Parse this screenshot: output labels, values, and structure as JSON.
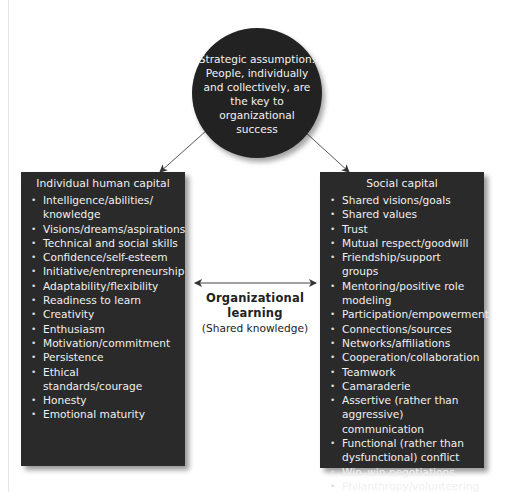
{
  "diagram": {
    "strategic_assumption": {
      "text": "Strategic assumption: People, individually and collectively, are the key to organizational success"
    },
    "individual_human_capital": {
      "title": "Individual human capital",
      "items": [
        "Intelligence/abilities/ knowledge",
        "Visions/dreams/aspirations",
        "Technical and social skills",
        "Confidence/self-esteem",
        "Initiative/entrepreneurship",
        "Adaptability/flexibility",
        "Readiness to learn",
        "Creativity",
        "Enthusiasm",
        "Motivation/commitment",
        "Persistence",
        "Ethical standards/courage",
        "Honesty",
        "Emotional maturity"
      ]
    },
    "social_capital": {
      "title": "Social capital",
      "items": [
        "Shared visions/goals",
        "Shared values",
        "Trust",
        "Mutual respect/goodwill",
        "Friendship/support groups",
        "Mentoring/positive role modeling",
        "Participation/empowerment",
        "Connections/sources",
        "Networks/affiliations",
        "Cooperation/collaboration",
        "Teamwork",
        "Camaraderie",
        "Assertive (rather than aggressive) communication",
        "Functional (rather than dysfunctional) conflict",
        "Win–win negotiations",
        "Philanthropy/volunteering"
      ]
    },
    "organizational_learning": {
      "title": "Organizational learning",
      "subtitle": "(Shared knowledge)"
    },
    "icons": {
      "arrow_left": "arrow-down-left-icon",
      "arrow_right": "arrow-down-right-icon",
      "double_arrow": "double-headed-arrow-icon"
    },
    "colors": {
      "box_fill": "#2a2a2a",
      "circle_fill": "#222222",
      "text_light": "#f0f0f0",
      "arrow": "#444444"
    }
  }
}
